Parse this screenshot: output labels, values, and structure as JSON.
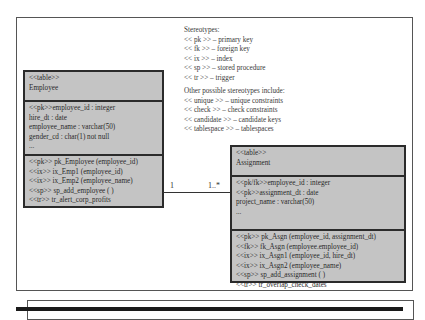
{
  "legend": {
    "title": "Stereotypes:",
    "items": [
      "<< pk >> – primary key",
      "<< fk >> – foreign key",
      "<< ix >> – index",
      "<< sp >> – stored procedure",
      "<< tr >> – trigger"
    ],
    "other_title": "Other possible stereotypes include:",
    "other_items": [
      "<< unique >> – unique constraints",
      "<< check >> – check constraints",
      "<< candidate >> – candidate keys",
      "<< tablespace >> – tablespaces"
    ]
  },
  "employee": {
    "stereotype": "<<table>>",
    "name": "Employee",
    "attributes": [
      "<<pk>>employee_id : integer",
      "hire_dt : date",
      "employee_name : varchar(50)",
      "gender_cd : char(1) not null",
      "..."
    ],
    "operations": [
      "<<pk>> pk_Employee (employee_id)",
      "<<ix>> ix_Emp1 (employee_id)",
      "<<ix>> ix_Emp2 (employee_name)",
      "<<sp>> sp_add_employee ( )",
      "<<tr>> tr_alert_corp_profits"
    ]
  },
  "assignment": {
    "stereotype": "<<table>>",
    "name": "Assignment",
    "attributes": [
      "<<pk/fk>>employee_id : integer",
      "<<pk>>assignment_dt : date",
      "project_name : varchar(50)",
      "..."
    ],
    "operations": [
      "<<pk>> pk_Asgn (employee_id, assignment_dt)",
      "<<fk>> fk_Asgn (employee.employee_id)",
      "<<ix>> ix_Asgn1 (employee_id, hire_dt)",
      "<<ix>> ix_Asgn2 (employee_name)",
      "<<sp>> sp_add_assignment ( )",
      "<<tr>> tr_overlap_check_dates"
    ]
  },
  "relationship": {
    "left_multiplicity": "1",
    "right_multiplicity": "1..*"
  },
  "colors": {
    "table_fill": "#c4c4c4",
    "table_border": "#2b2b2b",
    "frame_border": "#555555"
  }
}
